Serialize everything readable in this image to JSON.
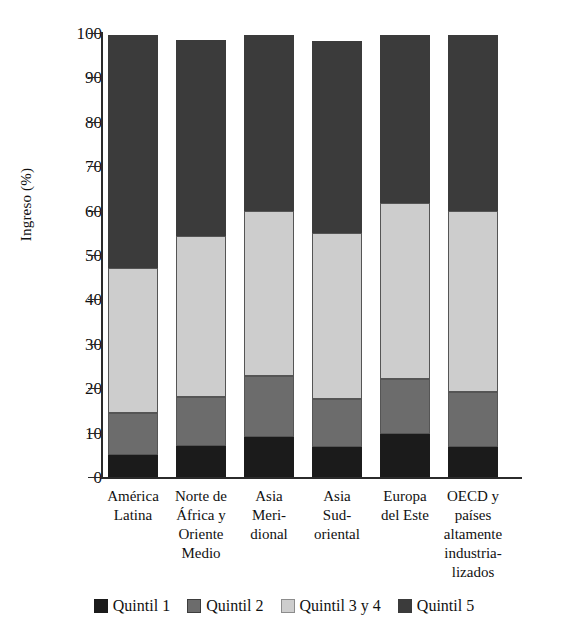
{
  "chart_data": {
    "type": "bar",
    "subtype": "stacked-bar-100",
    "title": "",
    "xlabel": "",
    "ylabel": "Ingreso (%)",
    "ylim": [
      0,
      100
    ],
    "yticks": [
      0,
      10,
      20,
      30,
      40,
      50,
      60,
      70,
      80,
      90,
      100
    ],
    "grid": false,
    "legend_position": "bottom",
    "categories": [
      "América Latina",
      "Norte de África y Oriente Medio",
      "Asia Meridional",
      "Asia Sudoriental",
      "Europa del Este",
      "OECD y países altamente industrializados"
    ],
    "category_lines": [
      [
        "América",
        "Latina"
      ],
      [
        "Norte de",
        "África y",
        "Oriente",
        "Medio"
      ],
      [
        "Asia",
        "Meri-",
        "dional"
      ],
      [
        "Asia",
        "Sud-",
        "oriental"
      ],
      [
        "Europa",
        "del Este"
      ],
      [
        "OECD y",
        "países",
        "altamente",
        "industria-",
        "lizados"
      ]
    ],
    "series": [
      {
        "name": "Quintil 1",
        "color": "#1b1b1b",
        "values": [
          5.0,
          7.0,
          9.0,
          6.8,
          9.7,
          6.8
        ]
      },
      {
        "name": "Quintil 2",
        "color": "#6c6c6c",
        "values": [
          9.5,
          11.0,
          13.7,
          10.7,
          12.3,
          12.3
        ]
      },
      {
        "name": "Quintil 3 y 4",
        "color": "#cdcdcd",
        "values": [
          32.5,
          36.2,
          37.3,
          37.5,
          39.8,
          40.9
        ]
      },
      {
        "name": "Quintil 5",
        "color": "#3b3b3b",
        "values": [
          52.5,
          44.3,
          39.5,
          43.2,
          37.7,
          39.5
        ]
      }
    ],
    "totals": [
      99.5,
      98.5,
      99.5,
      98.2,
      99.5,
      99.5
    ]
  },
  "legend": {
    "items": [
      {
        "label": "Quintil 1",
        "swatch": "q1"
      },
      {
        "label": "Quintil 2",
        "swatch": "q2"
      },
      {
        "label": "Quintil 3 y 4",
        "swatch": "q34"
      },
      {
        "label": "Quintil 5",
        "swatch": "q5"
      }
    ]
  }
}
